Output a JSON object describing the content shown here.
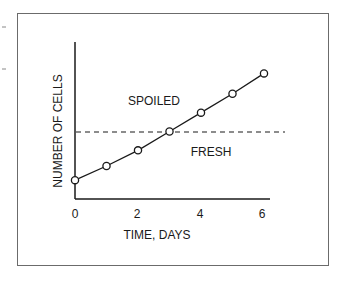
{
  "chart_data": {
    "type": "line",
    "title": "",
    "xlabel": "TIME, DAYS",
    "ylabel": "NUMBER OF CELLS",
    "x": [
      0,
      1,
      2,
      3,
      4,
      5,
      6
    ],
    "x_ticks": [
      0,
      2,
      4,
      6
    ],
    "xlim": [
      0,
      6
    ],
    "ylim": [
      0,
      100
    ],
    "y_ticks": [],
    "grid": false,
    "legend": null,
    "series": [
      {
        "name": "cell growth",
        "values": [
          12,
          21,
          31,
          43,
          55,
          67,
          80
        ],
        "marker": "open-circle"
      }
    ],
    "threshold": {
      "value": 43,
      "style": "dashed",
      "label_above": "SPOILED",
      "label_below": "FRESH"
    },
    "annotations": [
      "SPOILED",
      "FRESH"
    ]
  },
  "labels": {
    "xlabel": "TIME, DAYS",
    "ylabel": "NUMBER OF CELLS",
    "region_above": "SPOILED",
    "region_below": "FRESH",
    "ticks": [
      "0",
      "2",
      "4",
      "6"
    ]
  },
  "colors": {
    "line": "#1a1a1a",
    "frame": "#6b6b6b",
    "background": "#ffffff"
  }
}
